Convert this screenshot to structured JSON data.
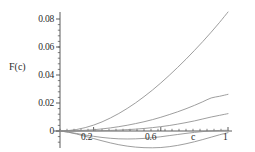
{
  "chart_data": {
    "type": "line",
    "title": "",
    "subtitle": "",
    "xlabel": "c",
    "ylabel": "F(c)",
    "xlim": [
      0,
      1.04
    ],
    "ylim": [
      -0.016,
      0.089
    ],
    "grid": false,
    "legend": false,
    "legend_position": "none",
    "x_ticks": [
      0.2,
      0.6,
      1
    ],
    "x_tick_labels": [
      "0.2",
      "0.6",
      "1"
    ],
    "x_minor_tick_count": 24,
    "y_ticks": [
      0,
      0.02,
      0.04,
      0.06,
      0.08
    ],
    "y_tick_labels": [
      "0",
      "0.02",
      "0.04",
      "0.06",
      "0.08"
    ],
    "y_minor_tick_count": 20,
    "line_color": "#8c8c8c",
    "axis_color": "#4a4a4a",
    "background": "#ffffff",
    "series": [
      {
        "name": "curve-1",
        "description": "steepest rising curve",
        "x": [
          0,
          0.05,
          0.1,
          0.15,
          0.2,
          0.25,
          0.3,
          0.35,
          0.4,
          0.45,
          0.5,
          0.55,
          0.6,
          0.65,
          0.7,
          0.75,
          0.8,
          0.85,
          0.9,
          0.95,
          1
        ],
        "values": [
          0.0,
          0.0003,
          0.0011,
          0.0024,
          0.0042,
          0.0065,
          0.0093,
          0.0125,
          0.0161,
          0.0201,
          0.0245,
          0.0292,
          0.0343,
          0.0397,
          0.0454,
          0.0513,
          0.0575,
          0.0639,
          0.0706,
          0.0776,
          0.085
        ]
      },
      {
        "name": "curve-2",
        "description": "second rising curve",
        "x": [
          0,
          0.05,
          0.1,
          0.15,
          0.2,
          0.25,
          0.3,
          0.35,
          0.4,
          0.45,
          0.5,
          0.55,
          0.6,
          0.65,
          0.7,
          0.75,
          0.8,
          0.85,
          0.9,
          0.95,
          1
        ],
        "values": [
          0.0,
          5e-05,
          0.0002,
          0.0005,
          0.0009,
          0.0015,
          0.0022,
          0.0031,
          0.0041,
          0.0053,
          0.0066,
          0.0081,
          0.0098,
          0.0117,
          0.0137,
          0.0159,
          0.0183,
          0.0209,
          0.0236,
          0.0248,
          0.0262
        ]
      },
      {
        "name": "curve-3",
        "description": "third rising curve, shallower",
        "x": [
          0,
          0.05,
          0.1,
          0.15,
          0.2,
          0.25,
          0.3,
          0.35,
          0.4,
          0.45,
          0.5,
          0.55,
          0.6,
          0.65,
          0.7,
          0.75,
          0.8,
          0.85,
          0.9,
          0.95,
          1
        ],
        "values": [
          0.0,
          0.0,
          2e-05,
          6e-05,
          0.00013,
          0.00025,
          0.00042,
          0.00065,
          0.00095,
          0.00134,
          0.0018,
          0.0024,
          0.0031,
          0.0039,
          0.0049,
          0.006,
          0.0072,
          0.0086,
          0.01,
          0.0112,
          0.0124
        ]
      },
      {
        "name": "curve-4",
        "description": "curve dipping below zero, returning toward zero at c=1",
        "x": [
          0,
          0.05,
          0.1,
          0.15,
          0.2,
          0.25,
          0.3,
          0.35,
          0.4,
          0.45,
          0.5,
          0.55,
          0.6,
          0.65,
          0.7,
          0.75,
          0.8,
          0.85,
          0.9,
          0.95,
          1
        ],
        "values": [
          0.0,
          -0.0008,
          -0.0018,
          -0.0029,
          -0.0038,
          -0.0046,
          -0.0052,
          -0.0056,
          -0.0057,
          -0.0056,
          -0.0053,
          -0.0048,
          -0.0041,
          -0.0033,
          -0.0025,
          -0.0017,
          -0.001,
          -0.0004,
          0.0001,
          0.0004,
          0.0005
        ]
      },
      {
        "name": "curve-5",
        "description": "deepest dipping curve, minimum near c=0.55",
        "x": [
          0,
          0.05,
          0.1,
          0.15,
          0.2,
          0.25,
          0.3,
          0.35,
          0.4,
          0.45,
          0.5,
          0.55,
          0.6,
          0.65,
          0.7,
          0.75,
          0.8,
          0.85,
          0.9,
          0.95,
          1
        ],
        "values": [
          0.0,
          -0.0009,
          -0.0022,
          -0.0038,
          -0.0054,
          -0.007,
          -0.0085,
          -0.0098,
          -0.0108,
          -0.0115,
          -0.0119,
          -0.012,
          -0.0118,
          -0.0112,
          -0.0103,
          -0.0091,
          -0.0077,
          -0.0061,
          -0.0044,
          -0.0027,
          -0.0012
        ]
      }
    ]
  },
  "axes": {
    "ylabel_text": "F(c)",
    "xlabel_text": "c"
  },
  "labels": {
    "y": [
      {
        "text": "0.08",
        "value": 0.08
      },
      {
        "text": "0.06",
        "value": 0.06
      },
      {
        "text": "0.04",
        "value": 0.04
      },
      {
        "text": "0.02",
        "value": 0.02
      },
      {
        "text": "0",
        "value": 0
      }
    ],
    "x": [
      {
        "text": "0.2",
        "value": 0.2
      },
      {
        "text": "0.6",
        "value": 0.6
      },
      {
        "text": "1",
        "value": 1
      }
    ]
  }
}
